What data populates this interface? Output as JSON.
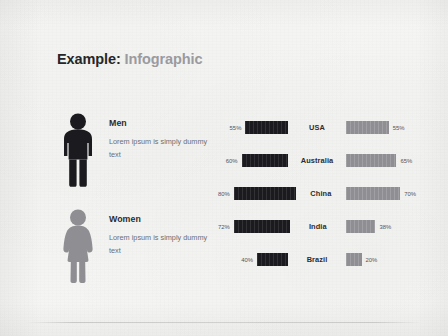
{
  "slide": {
    "title_primary": "Example:",
    "title_secondary": "Infographic",
    "background_color": "#f5f5f3"
  },
  "personas": [
    {
      "icon": "male-figure-icon",
      "name": "Men",
      "description": "Lorem ipsum is simply dummy text",
      "color": "#1b1b1f"
    },
    {
      "icon": "female-figure-icon",
      "name": "Women",
      "description": "Lorem ipsum is simply dummy text",
      "color": "#8e8e93"
    }
  ],
  "chart_data": {
    "type": "bar",
    "xlabel": "",
    "ylabel": "",
    "orientation": "horizontal-diverging",
    "categories": [
      "USA",
      "Australia",
      "China",
      "India",
      "Brazil"
    ],
    "series": [
      {
        "name": "Men",
        "color": "#1b1b1f",
        "side": "left",
        "values": [
          55,
          60,
          80,
          72,
          40
        ],
        "labels": [
          "55%",
          "60%",
          "80%",
          "72%",
          "40%"
        ]
      },
      {
        "name": "Women",
        "color": "#8e8e93",
        "side": "right",
        "values": [
          55,
          65,
          70,
          38,
          20
        ],
        "labels": [
          "55%",
          "65%",
          "70%",
          "38%",
          "20%"
        ]
      }
    ],
    "xlim": [
      0,
      100
    ],
    "grid": false,
    "legend": "left-personas"
  },
  "rows": [
    {
      "country": "USA",
      "left_label": "55%",
      "left_value": 55,
      "right_label": "55%",
      "right_value": 55
    },
    {
      "country": "Australia",
      "left_label": "60%",
      "left_value": 60,
      "right_label": "65%",
      "right_value": 65
    },
    {
      "country": "China",
      "left_label": "80%",
      "left_value": 80,
      "right_label": "70%",
      "right_value": 70
    },
    {
      "country": "India",
      "left_label": "72%",
      "left_value": 72,
      "right_label": "38%",
      "right_value": 38
    },
    {
      "country": "Brazil",
      "left_label": "40%",
      "left_value": 40,
      "right_label": "20%",
      "right_value": 20
    }
  ]
}
